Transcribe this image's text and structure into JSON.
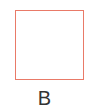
{
  "figure": {
    "shape": {
      "type": "square",
      "stroke_color": "#e97a68",
      "fill_color": "#ffffff"
    },
    "label": "B",
    "label_color": "#333333"
  }
}
